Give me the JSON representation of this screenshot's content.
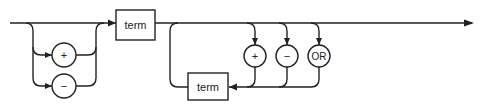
{
  "diagram": {
    "type": "railroad-syntax-diagram",
    "nodes": {
      "sign_plus": {
        "label": "+",
        "shape": "circle",
        "kind": "terminal"
      },
      "sign_minus": {
        "label": "−",
        "shape": "circle",
        "kind": "terminal"
      },
      "term_first": {
        "label": "term",
        "shape": "box",
        "kind": "nonterminal"
      },
      "op_plus": {
        "label": "+",
        "shape": "circle",
        "kind": "terminal"
      },
      "op_minus": {
        "label": "−",
        "shape": "circle",
        "kind": "terminal"
      },
      "op_or": {
        "label": "OR",
        "shape": "circle",
        "kind": "terminal"
      },
      "term_repeat": {
        "label": "term",
        "shape": "box",
        "kind": "nonterminal"
      }
    },
    "structure": [
      {
        "section": "optional-sign",
        "choices": [
          "(skip)",
          "+",
          "−"
        ]
      },
      {
        "section": "required",
        "item": "term"
      },
      {
        "section": "repeat-loop",
        "choices": [
          "+",
          "−",
          "OR"
        ],
        "then": "term"
      }
    ],
    "colors": {
      "stroke": "#222222",
      "background": "#ffffff"
    }
  }
}
